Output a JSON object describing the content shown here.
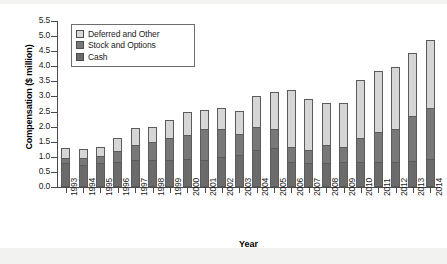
{
  "chart_data": {
    "type": "bar",
    "stacked": true,
    "title": "",
    "xlabel": "Year",
    "ylabel": "Compensation ($ million)",
    "ylim": [
      0.0,
      5.5
    ],
    "ytick_labels": [
      "0.0",
      "0.5",
      "1.0",
      "1.5",
      "2.0",
      "2.5",
      "3.0",
      "3.5",
      "4.0",
      "4.5",
      "5.0",
      "5.5"
    ],
    "ytick_values": [
      0.0,
      0.5,
      1.0,
      1.5,
      2.0,
      2.5,
      3.0,
      3.5,
      4.0,
      4.5,
      5.0,
      5.5
    ],
    "grid": false,
    "legend_position": "upper-left",
    "categories": [
      "1993",
      "1994",
      "1995",
      "1996",
      "1997",
      "1998",
      "1999",
      "2000",
      "2001",
      "2002",
      "2003",
      "2004",
      "2005",
      "2006",
      "2007",
      "2008",
      "2009",
      "2010",
      "2011",
      "2012",
      "2013",
      "2014"
    ],
    "series": [
      {
        "name": "Cash",
        "color": "#6b6b6b",
        "values": [
          0.75,
          0.71,
          0.75,
          0.8,
          0.87,
          0.85,
          0.86,
          0.88,
          0.87,
          0.96,
          1.04,
          1.19,
          1.26,
          0.81,
          0.75,
          0.76,
          0.78,
          0.79,
          0.79,
          0.81,
          0.84,
          0.88
        ]
      },
      {
        "name": "Stock and Options",
        "color": "#787878",
        "values": [
          0.19,
          0.22,
          0.23,
          0.37,
          0.48,
          0.62,
          0.74,
          0.8,
          1.02,
          0.94,
          0.68,
          0.77,
          0.62,
          0.49,
          0.45,
          0.59,
          0.52,
          0.81,
          1.0,
          1.09,
          1.48,
          1.72
        ]
      },
      {
        "name": "Deferred and Other",
        "color": "#d6d6d6",
        "values": [
          0.31,
          0.3,
          0.31,
          0.41,
          0.57,
          0.49,
          0.59,
          0.76,
          0.64,
          0.7,
          0.75,
          1.02,
          1.22,
          1.87,
          1.7,
          1.4,
          1.45,
          1.92,
          2.01,
          2.05,
          2.08,
          2.25
        ]
      }
    ],
    "totals": [
      1.25,
      1.23,
      1.29,
      1.58,
      1.92,
      1.96,
      2.19,
      2.44,
      2.53,
      2.6,
      2.47,
      2.98,
      3.1,
      3.17,
      2.9,
      2.75,
      2.75,
      3.52,
      3.8,
      3.95,
      4.4,
      4.85
    ]
  },
  "legend": {
    "items": [
      {
        "label": "Deferred and Other",
        "color": "#d6d6d6"
      },
      {
        "label": "Stock and Options",
        "color": "#787878"
      },
      {
        "label": "Cash",
        "color": "#6b6b6b"
      }
    ]
  }
}
